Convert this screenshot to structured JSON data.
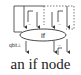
{
  "diagram": {
    "node_label": "if",
    "caption": "an if node",
    "inputs": [
      {
        "label": "Γ",
        "dots": "..."
      },
      {
        "label": "Γ",
        "dots": "..."
      }
    ],
    "outputs": [
      {
        "label": "qbit⊥"
      },
      {
        "label": "Γ",
        "dots": "..."
      }
    ],
    "colors": {
      "stroke": "#333333",
      "background": "#ffffff"
    }
  }
}
